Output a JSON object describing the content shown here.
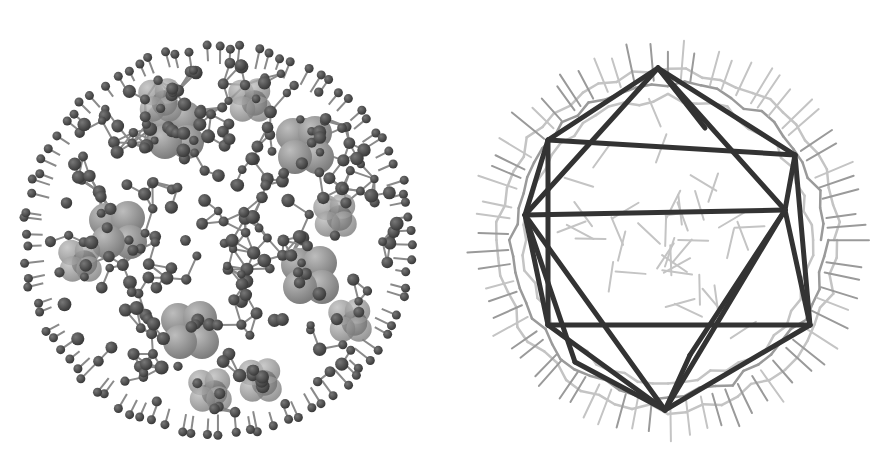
{
  "figure": {
    "panels": [
      {
        "id": "left",
        "description": "Ball-and-stick model of spherical molecular cluster with space-filling methyl groups",
        "colors": {
          "atom_dark": "#3a3a3a",
          "bond": "#8a8a8a",
          "spacefill_light": "#9a9a9a",
          "spacefill_dark": "#1e1e1e"
        }
      },
      {
        "id": "right",
        "description": "Wireframe of cluster with inscribed icosahedron highlighted",
        "colors": {
          "icosahedron_edge": "#333333",
          "wire_light": "#c4c4c4",
          "wire_mid": "#9a9a9a"
        }
      }
    ]
  }
}
